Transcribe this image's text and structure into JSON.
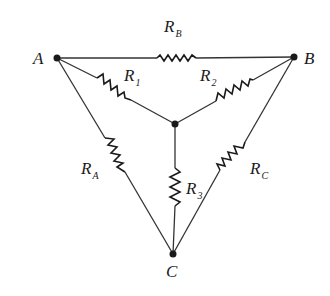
{
  "diagram": {
    "title": "",
    "nodes": [
      {
        "id": "A",
        "label": "A"
      },
      {
        "id": "B",
        "label": "B"
      },
      {
        "id": "C",
        "label": "C"
      },
      {
        "id": "N",
        "label": ""
      }
    ],
    "resistors": [
      {
        "id": "RB",
        "letter": "R",
        "sub": "B",
        "between": [
          "A",
          "B"
        ]
      },
      {
        "id": "R1",
        "letter": "R",
        "sub": "1",
        "between": [
          "A",
          "N"
        ]
      },
      {
        "id": "R2",
        "letter": "R",
        "sub": "2",
        "between": [
          "N",
          "B"
        ]
      },
      {
        "id": "RA",
        "letter": "R",
        "sub": "A",
        "between": [
          "A",
          "C"
        ]
      },
      {
        "id": "R3",
        "letter": "R",
        "sub": "3",
        "between": [
          "N",
          "C"
        ]
      },
      {
        "id": "RC",
        "letter": "R",
        "sub": "C",
        "between": [
          "B",
          "C"
        ]
      }
    ],
    "colors": {
      "ink": "#1a1a1a",
      "wire": "#333333",
      "background": "#ffffff"
    }
  }
}
